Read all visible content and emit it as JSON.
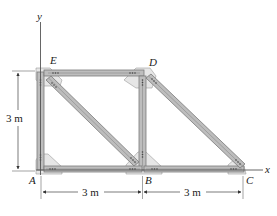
{
  "figure": {
    "type": "truss",
    "joints": {
      "A": {
        "label": "A"
      },
      "B": {
        "label": "B"
      },
      "C": {
        "label": "C"
      },
      "D": {
        "label": "D"
      },
      "E": {
        "label": "E"
      }
    },
    "members": [
      "AE",
      "ED",
      "AB",
      "BC",
      "BD",
      "AD_diag_EB",
      "DC"
    ],
    "axes": {
      "x_label": "x",
      "y_label": "y"
    },
    "dimensions": {
      "height": "3 m",
      "span_AB": "3 m",
      "span_BC": "3 m"
    }
  }
}
